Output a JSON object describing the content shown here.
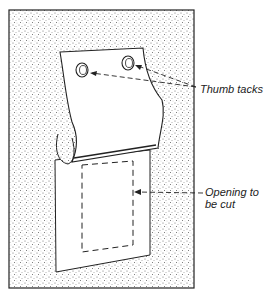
{
  "figure": {
    "type": "technical-illustration",
    "colors": {
      "ink": "#222222",
      "background": "#ffffff",
      "stipple": "#555555"
    }
  },
  "callouts": [
    {
      "id": "thumb-tacks",
      "line1": "Thumb tacks",
      "line2": ""
    },
    {
      "id": "opening",
      "line1": "Opening to",
      "line2": "be cut"
    }
  ]
}
